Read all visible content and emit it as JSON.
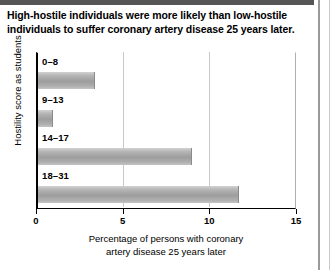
{
  "chart_data": {
    "type": "bar",
    "orientation": "horizontal",
    "title": "High-hostile individuals were more likely than low-hostile individuals to suffer coronary artery disease 25 years later.",
    "categories": [
      "0–8",
      "9–13",
      "14–17",
      "18–31"
    ],
    "values": [
      3.4,
      1.0,
      9.0,
      11.7
    ],
    "xlabel": "Percentage of persons with coronary artery disease 25 years later",
    "ylabel": "Hostility score as students",
    "xlim": [
      0,
      15
    ],
    "xticks": [
      0,
      5,
      10,
      15
    ],
    "xtick_labels": [
      "0",
      "5",
      "10",
      "15"
    ],
    "grid": true,
    "grid_axis": "x",
    "legend": null,
    "bar_color": "#a9a9a9",
    "axis_color": "#000000",
    "gridline_color": "#c9c9c9",
    "background": "#ffffff"
  },
  "figure": {
    "title_line_1": "High-hostile individuals were more likely than low-hostile",
    "title_line_2": "individuals to suffer coronary artery disease 25 years later.",
    "xlabel_line_1": "Percentage of persons with coronary",
    "xlabel_line_2": "artery disease 25 years later",
    "ylabel": "Hostility score as students"
  }
}
